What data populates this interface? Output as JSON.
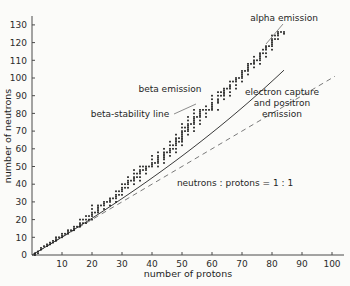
{
  "chart_data": {
    "type": "scatter",
    "title": "",
    "xlabel": "number of protons",
    "ylabel": "number of neutrons",
    "xlim": [
      0,
      105
    ],
    "ylim": [
      0,
      135
    ],
    "xticks": [
      10,
      20,
      30,
      40,
      50,
      60,
      70,
      80,
      90,
      100
    ],
    "yticks": [
      0,
      10,
      20,
      30,
      40,
      50,
      60,
      70,
      80,
      90,
      100,
      110,
      120,
      130
    ],
    "grid": false,
    "legend": "none",
    "series": [
      {
        "name": "stable nuclides",
        "marker": "small square",
        "color": "#1b1b1b",
        "points": [
          [
            1,
            0
          ],
          [
            1,
            1
          ],
          [
            2,
            1
          ],
          [
            2,
            2
          ],
          [
            3,
            3
          ],
          [
            3,
            4
          ],
          [
            4,
            5
          ],
          [
            5,
            5
          ],
          [
            5,
            6
          ],
          [
            6,
            6
          ],
          [
            6,
            7
          ],
          [
            7,
            7
          ],
          [
            7,
            8
          ],
          [
            8,
            8
          ],
          [
            8,
            9
          ],
          [
            8,
            10
          ],
          [
            9,
            10
          ],
          [
            10,
            10
          ],
          [
            10,
            11
          ],
          [
            10,
            12
          ],
          [
            11,
            12
          ],
          [
            12,
            12
          ],
          [
            12,
            13
          ],
          [
            12,
            14
          ],
          [
            13,
            14
          ],
          [
            14,
            14
          ],
          [
            14,
            15
          ],
          [
            14,
            16
          ],
          [
            15,
            16
          ],
          [
            16,
            16
          ],
          [
            16,
            17
          ],
          [
            16,
            18
          ],
          [
            16,
            20
          ],
          [
            17,
            18
          ],
          [
            17,
            20
          ],
          [
            18,
            18
          ],
          [
            18,
            20
          ],
          [
            18,
            22
          ],
          [
            19,
            20
          ],
          [
            19,
            22
          ],
          [
            20,
            20
          ],
          [
            20,
            22
          ],
          [
            20,
            23
          ],
          [
            20,
            24
          ],
          [
            20,
            26
          ],
          [
            20,
            28
          ],
          [
            21,
            24
          ],
          [
            22,
            24
          ],
          [
            22,
            25
          ],
          [
            22,
            26
          ],
          [
            22,
            27
          ],
          [
            22,
            28
          ],
          [
            23,
            28
          ],
          [
            24,
            26
          ],
          [
            24,
            28
          ],
          [
            24,
            29
          ],
          [
            24,
            30
          ],
          [
            25,
            30
          ],
          [
            26,
            28
          ],
          [
            26,
            30
          ],
          [
            26,
            31
          ],
          [
            26,
            32
          ],
          [
            27,
            32
          ],
          [
            28,
            30
          ],
          [
            28,
            32
          ],
          [
            28,
            33
          ],
          [
            28,
            34
          ],
          [
            28,
            36
          ],
          [
            29,
            34
          ],
          [
            29,
            36
          ],
          [
            30,
            34
          ],
          [
            30,
            36
          ],
          [
            30,
            37
          ],
          [
            30,
            38
          ],
          [
            30,
            40
          ],
          [
            31,
            38
          ],
          [
            31,
            40
          ],
          [
            32,
            38
          ],
          [
            32,
            40
          ],
          [
            32,
            41
          ],
          [
            32,
            42
          ],
          [
            32,
            44
          ],
          [
            33,
            42
          ],
          [
            34,
            40
          ],
          [
            34,
            42
          ],
          [
            34,
            43
          ],
          [
            34,
            44
          ],
          [
            34,
            46
          ],
          [
            34,
            48
          ],
          [
            35,
            44
          ],
          [
            35,
            46
          ],
          [
            36,
            42
          ],
          [
            36,
            44
          ],
          [
            36,
            46
          ],
          [
            36,
            47
          ],
          [
            36,
            48
          ],
          [
            36,
            50
          ],
          [
            37,
            48
          ],
          [
            37,
            50
          ],
          [
            38,
            46
          ],
          [
            38,
            48
          ],
          [
            38,
            49
          ],
          [
            38,
            50
          ],
          [
            39,
            50
          ],
          [
            40,
            50
          ],
          [
            40,
            51
          ],
          [
            40,
            52
          ],
          [
            40,
            54
          ],
          [
            40,
            56
          ],
          [
            41,
            52
          ],
          [
            42,
            50
          ],
          [
            42,
            52
          ],
          [
            42,
            53
          ],
          [
            42,
            54
          ],
          [
            42,
            55
          ],
          [
            42,
            56
          ],
          [
            42,
            58
          ],
          [
            44,
            52
          ],
          [
            44,
            54
          ],
          [
            44,
            55
          ],
          [
            44,
            56
          ],
          [
            44,
            57
          ],
          [
            44,
            58
          ],
          [
            44,
            60
          ],
          [
            45,
            58
          ],
          [
            46,
            56
          ],
          [
            46,
            58
          ],
          [
            46,
            59
          ],
          [
            46,
            60
          ],
          [
            46,
            62
          ],
          [
            46,
            64
          ],
          [
            47,
            60
          ],
          [
            47,
            62
          ],
          [
            48,
            58
          ],
          [
            48,
            60
          ],
          [
            48,
            62
          ],
          [
            48,
            63
          ],
          [
            48,
            64
          ],
          [
            48,
            65
          ],
          [
            48,
            66
          ],
          [
            48,
            68
          ],
          [
            49,
            64
          ],
          [
            49,
            66
          ],
          [
            50,
            62
          ],
          [
            50,
            64
          ],
          [
            50,
            65
          ],
          [
            50,
            66
          ],
          [
            50,
            67
          ],
          [
            50,
            68
          ],
          [
            50,
            69
          ],
          [
            50,
            70
          ],
          [
            50,
            72
          ],
          [
            50,
            74
          ],
          [
            51,
            70
          ],
          [
            51,
            72
          ],
          [
            52,
            68
          ],
          [
            52,
            70
          ],
          [
            52,
            71
          ],
          [
            52,
            72
          ],
          [
            52,
            73
          ],
          [
            52,
            74
          ],
          [
            52,
            76
          ],
          [
            52,
            78
          ],
          [
            53,
            74
          ],
          [
            54,
            70
          ],
          [
            54,
            72
          ],
          [
            54,
            74
          ],
          [
            54,
            75
          ],
          [
            54,
            76
          ],
          [
            54,
            77
          ],
          [
            54,
            78
          ],
          [
            54,
            80
          ],
          [
            54,
            82
          ],
          [
            55,
            78
          ],
          [
            56,
            74
          ],
          [
            56,
            76
          ],
          [
            56,
            78
          ],
          [
            56,
            79
          ],
          [
            56,
            80
          ],
          [
            56,
            81
          ],
          [
            56,
            82
          ],
          [
            57,
            82
          ],
          [
            58,
            78
          ],
          [
            58,
            80
          ],
          [
            58,
            82
          ],
          [
            58,
            84
          ],
          [
            59,
            82
          ],
          [
            60,
            82
          ],
          [
            60,
            83
          ],
          [
            60,
            84
          ],
          [
            60,
            85
          ],
          [
            60,
            86
          ],
          [
            60,
            88
          ],
          [
            60,
            90
          ],
          [
            62,
            82
          ],
          [
            62,
            86
          ],
          [
            62,
            87
          ],
          [
            62,
            88
          ],
          [
            62,
            90
          ],
          [
            62,
            92
          ],
          [
            63,
            90
          ],
          [
            63,
            92
          ],
          [
            64,
            88
          ],
          [
            64,
            90
          ],
          [
            64,
            91
          ],
          [
            64,
            92
          ],
          [
            64,
            93
          ],
          [
            64,
            94
          ],
          [
            65,
            94
          ],
          [
            66,
            90
          ],
          [
            66,
            92
          ],
          [
            66,
            94
          ],
          [
            66,
            95
          ],
          [
            66,
            96
          ],
          [
            66,
            98
          ],
          [
            67,
            98
          ],
          [
            68,
            94
          ],
          [
            68,
            96
          ],
          [
            68,
            98
          ],
          [
            68,
            99
          ],
          [
            68,
            100
          ],
          [
            69,
            100
          ],
          [
            70,
            98
          ],
          [
            70,
            100
          ],
          [
            70,
            101
          ],
          [
            70,
            102
          ],
          [
            70,
            103
          ],
          [
            70,
            104
          ],
          [
            71,
            104
          ],
          [
            72,
            102
          ],
          [
            72,
            104
          ],
          [
            72,
            105
          ],
          [
            72,
            106
          ],
          [
            72,
            107
          ],
          [
            72,
            108
          ],
          [
            73,
            108
          ],
          [
            74,
            106
          ],
          [
            74,
            108
          ],
          [
            74,
            109
          ],
          [
            74,
            110
          ],
          [
            74,
            112
          ],
          [
            75,
            110
          ],
          [
            76,
            108
          ],
          [
            76,
            110
          ],
          [
            76,
            111
          ],
          [
            76,
            112
          ],
          [
            76,
            113
          ],
          [
            76,
            114
          ],
          [
            77,
            114
          ],
          [
            77,
            116
          ],
          [
            78,
            112
          ],
          [
            78,
            114
          ],
          [
            78,
            116
          ],
          [
            78,
            117
          ],
          [
            78,
            118
          ],
          [
            79,
            118
          ],
          [
            80,
            116
          ],
          [
            80,
            118
          ],
          [
            80,
            119
          ],
          [
            80,
            120
          ],
          [
            80,
            121
          ],
          [
            80,
            122
          ],
          [
            80,
            124
          ],
          [
            81,
            122
          ],
          [
            81,
            124
          ],
          [
            82,
            122
          ],
          [
            82,
            124
          ],
          [
            82,
            125
          ],
          [
            82,
            126
          ],
          [
            83,
            126
          ],
          [
            84,
            125
          ],
          [
            84,
            126
          ]
        ]
      }
    ],
    "reference_lines": [
      {
        "name": "neutrons-protons-1-1",
        "label": "neutrons : protons = 1 : 1",
        "style": "dashed",
        "from": [
          0,
          0
        ],
        "to": [
          101,
          101
        ]
      },
      {
        "name": "beta-stability-line",
        "label": "beta-stability line",
        "style": "solid",
        "description": "curve through the centre of the stable nuclide band"
      }
    ],
    "annotations": [
      {
        "id": "alpha",
        "text": "alpha emission",
        "lines": [
          "alpha emission"
        ]
      },
      {
        "id": "beta",
        "text": "beta emission",
        "lines": [
          "beta emission"
        ]
      },
      {
        "id": "ec",
        "text": "electron capture and positron emission",
        "lines": [
          "electron capture",
          "and positron",
          "emission"
        ]
      },
      {
        "id": "stability",
        "text": "beta-stability line",
        "lines": [
          "beta-stability line"
        ]
      },
      {
        "id": "ratio",
        "text": "neutrons : protons = 1 : 1",
        "lines": [
          "neutrons : protons = 1 : 1"
        ]
      }
    ]
  },
  "axes": {
    "x": {
      "title": "number of protons",
      "ticks": [
        "10",
        "20",
        "30",
        "40",
        "50",
        "60",
        "70",
        "80",
        "90",
        "100"
      ]
    },
    "y": {
      "title": "number of neutrons",
      "ticks": [
        "0",
        "10",
        "20",
        "30",
        "40",
        "50",
        "60",
        "70",
        "80",
        "90",
        "100",
        "110",
        "120",
        "130"
      ]
    }
  },
  "labels": {
    "alpha_emission": "alpha emission",
    "beta_emission": "beta emission",
    "beta_stability_line": "beta-stability line",
    "electron_capture_1": "electron capture",
    "electron_capture_2": "and positron",
    "electron_capture_3": "emission",
    "ratio": "neutrons : protons = 1 : 1"
  },
  "colors": {
    "background": "#fbfbf9",
    "axis": "#4a4a4a",
    "dot": "#1b1b1b",
    "dashed_line": "#7a7a7a",
    "curve": "#3a3a3a",
    "text": "#1f1f1f"
  }
}
